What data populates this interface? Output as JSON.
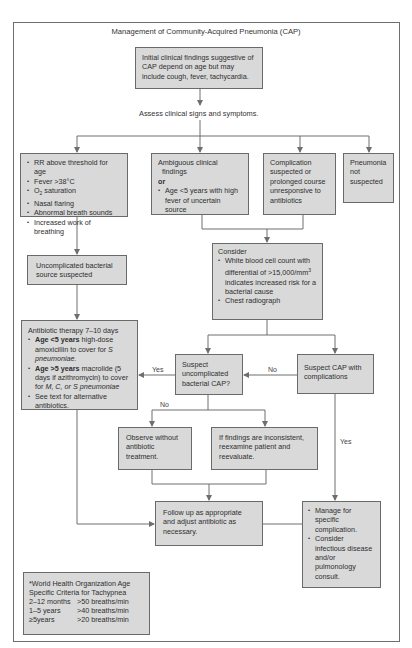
{
  "title": "Management of Community-Acquired Pneumonia (CAP)",
  "nodes": {
    "initial": "Initial clinical findings suggestive of CAP depend on age but may include cough, fever, tachycardia.",
    "assess": "Assess clinical signs and symptoms.",
    "clinical_signs": {
      "items": [
        "RR above threshold for age",
        "Fever >38°C",
        "O2 saturation",
        "Nasal flaring",
        "Abnormal breath sounds",
        "Increased work of breathing"
      ],
      "o2_prefix": "O",
      "o2_sub": "2",
      "o2_suffix": " saturation"
    },
    "ambiguous": {
      "line1": "Ambiguous clinical",
      "line2": "findings",
      "or": "or",
      "item": "Age <5 years with high fever of uncertain source"
    },
    "complication_suspected": "Complication suspected or prolonged course unresponsive to antibiotics",
    "not_suspected": "Pneumonia not suspected",
    "consider": {
      "heading": "Consider",
      "wbc_prefix": "White blood cell count with differential of >15,000/mm",
      "wbc_sup": "3",
      "wbc_suffix": " indicates increased risk for a bacterial cause",
      "radiograph": "Chest radiograph"
    },
    "uncomplicated_bacterial": "Uncomplicated bacterial source suspected",
    "antibiotic": {
      "heading": "Antibiotic therapy 7–10 days",
      "item1_bold": "Age <5 years",
      "item1_text": " high-dose amoxicillin to cover for ",
      "item1_italic": "S pneumoniae.",
      "item2_bold": "Age >5 years",
      "item2_text": " macrolide (5 days if azithromycin) to cover for ",
      "item2_italic": "M, C, or S pneumoniae",
      "item3": "See text for alternative antibiotics."
    },
    "suspect_uncomplicated": "Suspect uncomplicated bacterial CAP?",
    "suspect_complications": "Suspect CAP with complications",
    "observe": "Observe without antibiotic treatment.",
    "inconsistent": "If findings are inconsistent, reexamine patient and reevaluate.",
    "follow_up": "Follow up as appropriate and adjust antibiotic as necessary.",
    "manage": {
      "item1": "Manage for specific complication.",
      "item2": "Consider infectious disease and/or pulmonology consult."
    },
    "who": {
      "heading": "*World Health Organization Age Specific Criteria for Tachypnea",
      "rows": [
        {
          "age": "2–12 months",
          "rate": ">50 breaths/min"
        },
        {
          "age": "1–5 years",
          "rate": ">40 breaths/min"
        },
        {
          "age": "≥5years",
          "rate": ">20 breaths/min"
        }
      ]
    }
  },
  "edge_labels": {
    "yes_left": "Yes",
    "no_right": "No",
    "no_down": "No",
    "yes_down": "Yes"
  },
  "colors": {
    "box_fill": "#d9d9d9",
    "box_border": "#6a6a6a",
    "line": "#6e6e6e"
  }
}
